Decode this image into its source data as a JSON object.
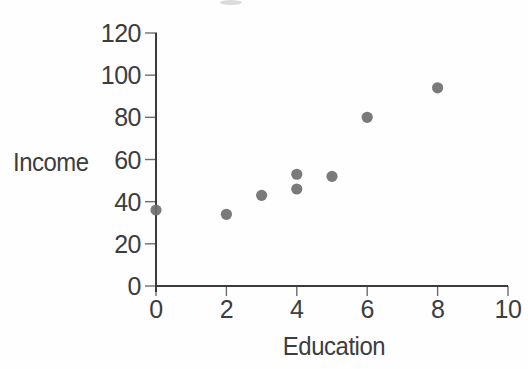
{
  "chart_data": {
    "type": "scatter",
    "title": "",
    "xlabel": "Education",
    "ylabel": "Income",
    "xlim": [
      0,
      10
    ],
    "ylim": [
      0,
      120
    ],
    "x_ticks": [
      0,
      2,
      4,
      6,
      8,
      10
    ],
    "y_ticks": [
      0,
      20,
      40,
      60,
      80,
      100,
      120
    ],
    "x_tick_labels": [
      "0",
      "2",
      "4",
      "6",
      "8",
      "10"
    ],
    "y_tick_labels": [
      "0",
      "20",
      "40",
      "60",
      "80",
      "100",
      "120"
    ],
    "points": [
      {
        "x": 0,
        "y": 36
      },
      {
        "x": 2,
        "y": 34
      },
      {
        "x": 3,
        "y": 43
      },
      {
        "x": 4,
        "y": 46
      },
      {
        "x": 4,
        "y": 53
      },
      {
        "x": 5,
        "y": 52
      },
      {
        "x": 6,
        "y": 80
      },
      {
        "x": 8,
        "y": 94
      }
    ],
    "grid": false,
    "legend": null,
    "point_color": "#6f6f6f",
    "axis_color": "#3a3a3a",
    "tick_color": "#6d6d6d",
    "text_color": "#3d3d3d"
  }
}
